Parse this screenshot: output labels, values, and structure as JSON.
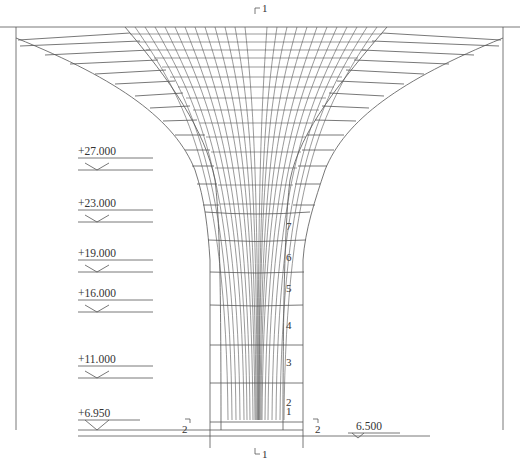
{
  "drawing": {
    "title_marker_top": "1",
    "title_marker_bottom": "1",
    "section_marker_left": "2",
    "section_marker_right": "2",
    "ground_level_right": "6.500",
    "colors": {
      "line": "#555555",
      "text": "#333333",
      "background": "#ffffff"
    }
  },
  "elevations": [
    {
      "label": "+27.000",
      "y": 170
    },
    {
      "label": "+23.000",
      "y": 220
    },
    {
      "label": "+19.000",
      "y": 270
    },
    {
      "label": "+16.000",
      "y": 310
    },
    {
      "label": "+11.000",
      "y": 377
    },
    {
      "label": "+6.950",
      "y": 423
    }
  ],
  "floors": [
    {
      "label": "7",
      "y": 226
    },
    {
      "label": "6",
      "y": 257
    },
    {
      "label": "5",
      "y": 288
    },
    {
      "label": "4",
      "y": 325
    },
    {
      "label": "3",
      "y": 362
    },
    {
      "label": "2",
      "y": 402
    },
    {
      "label": "1",
      "y": 441
    }
  ]
}
